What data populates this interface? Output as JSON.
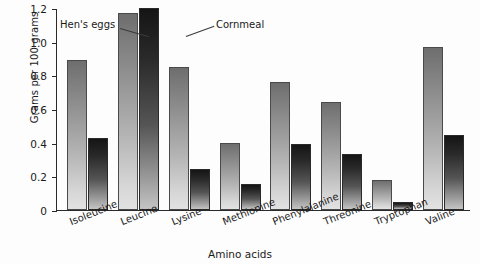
{
  "chart_data": {
    "type": "bar",
    "title": "",
    "xlabel": "Amino acids",
    "ylabel": "Grams per 100 grams",
    "categories": [
      "Isoleucine",
      "Leucine",
      "Lysine",
      "Methionine",
      "Phenylalanine",
      "Threonine",
      "Tryptophan",
      "Valine"
    ],
    "series": [
      {
        "name": "Hen's eggs",
        "values": [
          0.89,
          1.17,
          0.85,
          0.4,
          0.76,
          0.64,
          0.18,
          0.97
        ]
      },
      {
        "name": "Cornmeal",
        "values": [
          0.43,
          1.2,
          0.245,
          0.155,
          0.395,
          0.335,
          0.045,
          0.445
        ]
      }
    ],
    "ylim": [
      0,
      1.2
    ],
    "ytick_labels": [
      "1.2",
      "1.0",
      "0.8",
      "0.6",
      "0.4",
      "0.2",
      "0"
    ],
    "ytick_values": [
      1.2,
      1.0,
      0.8,
      0.6,
      0.4,
      0.2,
      0
    ],
    "grid": false,
    "legend_position": "inline-annotations",
    "annotations": [
      {
        "text": "Hen's eggs",
        "target": "Leucine hen's eggs bar"
      },
      {
        "text": "Cornmeal",
        "target": "Leucine cornmeal bar"
      }
    ],
    "colors": {
      "hens_eggs": "#9b9b9b",
      "cornmeal": "#2a2a2a",
      "axis": "#2a2a2a",
      "background": "#fdfdfd"
    }
  }
}
